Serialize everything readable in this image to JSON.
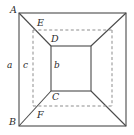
{
  "figure": {
    "stroke_color": "#4a4a4a",
    "dash_color": "#8d8d8d",
    "label_color": "#2b2b2b",
    "background": "#ffffff"
  },
  "labels": {
    "A": "A",
    "B": "B",
    "C": "C",
    "D": "D",
    "E": "E",
    "F": "F",
    "a": "a",
    "b": "b",
    "c": "c"
  },
  "geometry": {
    "outer_rect": {
      "x1": 19,
      "y1": 13,
      "x2": 126,
      "y2": 126
    },
    "inner_rect": {
      "x1": 51,
      "y1": 46,
      "x2": 91,
      "y2": 91
    },
    "dashed_rect": {
      "x1": 33,
      "y1": 30,
      "x2": 112,
      "y2": 106
    },
    "diagonals": [
      {
        "from": "outer-top-left",
        "to": "inner-top-left"
      },
      {
        "from": "outer-top-right",
        "to": "inner-top-right"
      },
      {
        "from": "outer-bottom-left",
        "to": "inner-bottom-left"
      },
      {
        "from": "outer-bottom-right",
        "to": "inner-bottom-right"
      }
    ]
  },
  "label_positions": {
    "A": {
      "x": 10,
      "y": 5
    },
    "B": {
      "x": 9,
      "y": 118
    },
    "C": {
      "x": 52,
      "y": 92
    },
    "D": {
      "x": 51,
      "y": 34
    },
    "E": {
      "x": 37,
      "y": 18
    },
    "F": {
      "x": 37,
      "y": 110
    },
    "a": {
      "x": 7,
      "y": 61
    },
    "b": {
      "x": 54,
      "y": 61
    },
    "c": {
      "x": 23,
      "y": 61
    }
  }
}
